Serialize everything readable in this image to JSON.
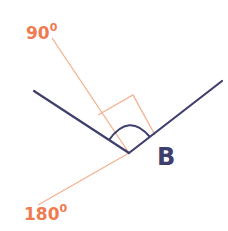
{
  "diagram": {
    "labels": {
      "top": {
        "value": "90",
        "superscript": "0"
      },
      "bottom": {
        "value": "180",
        "superscript": "0"
      },
      "vertex": "B"
    },
    "colors": {
      "angle_lines": "#3f3f6e",
      "protractor_lines": "#f5b08e",
      "label_orange": "#f07a50"
    },
    "geometry": {
      "vertex": [
        129,
        153
      ],
      "left_ray_end": [
        34,
        91
      ],
      "right_ray_end": [
        222,
        81
      ],
      "line_90_end": [
        52,
        38
      ],
      "line_180_end": [
        38,
        205
      ],
      "right_angle_box": [
        [
          98,
          115
        ],
        [
          133,
          95
        ],
        [
          155,
          135
        ],
        [
          122,
          155
        ]
      ]
    }
  }
}
